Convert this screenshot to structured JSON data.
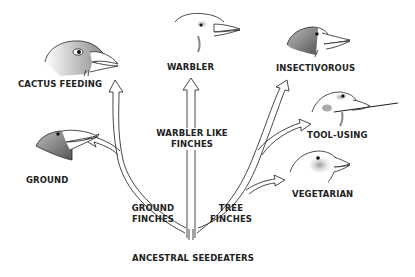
{
  "diagram": {
    "root": {
      "label": "ANCESTRAL SEEDEATERS"
    },
    "branches": [
      {
        "label_line1": "GROUND",
        "label_line2": "FINCHES"
      },
      {
        "label_line1": "WARBLER LIKE",
        "label_line2": "FINCHES"
      },
      {
        "label_line1": "TREE",
        "label_line2": "FINCHES"
      }
    ],
    "species": [
      {
        "label": "CACTUS FEEDING",
        "icon": "finch-head-icon"
      },
      {
        "label": "GROUND",
        "icon": "finch-head-icon"
      },
      {
        "label": "WARBLER",
        "icon": "finch-head-icon"
      },
      {
        "label": "INSECTIVOROUS",
        "icon": "finch-head-icon"
      },
      {
        "label": "TOOL-USING",
        "icon": "finch-head-icon"
      },
      {
        "label": "VEGETARIAN",
        "icon": "finch-head-icon"
      }
    ],
    "colors": {
      "line": "#333333",
      "text": "#222222",
      "shade": "#7a7a7a"
    }
  }
}
